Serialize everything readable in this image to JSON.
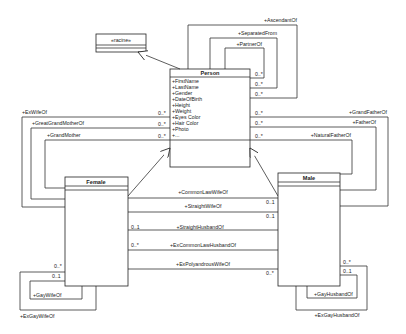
{
  "diagram": {
    "type": "uml-class-diagram",
    "classes": {
      "racine": {
        "name": "«racine»"
      },
      "person": {
        "name": "Person",
        "attributes": [
          "+FirstName",
          "+LastName",
          "+Gender",
          "+DateOfBirth",
          "+Height",
          "+Weight",
          "+Eyes Color",
          "+Hair Color",
          "+Photo",
          "+..."
        ]
      },
      "female": {
        "name": "Female"
      },
      "male": {
        "name": "Male"
      }
    },
    "person_self_associations": [
      {
        "role": "+PartnerOf",
        "multiplicity": "0..*"
      },
      {
        "role": "+SeparatedFrom",
        "multiplicity": "0..*"
      },
      {
        "role": "+AscendantOf",
        "multiplicity": "0..*"
      }
    ],
    "female_to_person": [
      {
        "role": "+ExWifeOf",
        "multiplicity": "0..*"
      },
      {
        "role": "+GreatGrandMotherOf",
        "multiplicity": "0..*"
      },
      {
        "role": "+GrandMother",
        "multiplicity": "0..*"
      }
    ],
    "male_to_person": [
      {
        "role": "+GrandFatherOf",
        "multiplicity": "0..*"
      },
      {
        "role": "+FatherOf",
        "multiplicity": "0..*"
      },
      {
        "role": "+NaturalFatherOf",
        "multiplicity": "0..*"
      }
    ],
    "female_male": [
      {
        "role": "+CommonLawWifeOf",
        "multiplicity": "0..1",
        "side": "male"
      },
      {
        "role": "+StraightWifeOf",
        "multiplicity": "0..1",
        "side": "male"
      },
      {
        "role": "+StraightHusbandOf",
        "multiplicity": "0..1",
        "side": "female"
      },
      {
        "role": "+ExCommonLawHusbandOf",
        "multiplicity": "0..*",
        "side": "female"
      },
      {
        "role": "+ExPolyandrousWifeOf",
        "multiplicity": "0..*",
        "side": "male"
      }
    ],
    "female_self": [
      {
        "role": "+GayWifeOf",
        "multiplicity": "0..1"
      },
      {
        "role": "+ExGayWifeOf",
        "multiplicity": "0..*"
      }
    ],
    "male_self": [
      {
        "role": "+GayHusbandOf",
        "multiplicity": "0..1"
      },
      {
        "role": "+ExGayHusbandOf",
        "multiplicity": "0..*"
      }
    ]
  }
}
